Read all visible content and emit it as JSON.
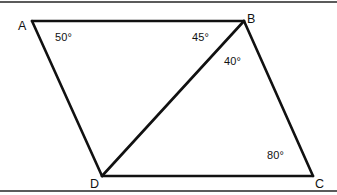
{
  "figure": {
    "type": "geometry-diagram",
    "canvas": {
      "width": 337,
      "height": 195,
      "background": "#ffffff"
    },
    "stroke_color": "#111111",
    "frame_color": "#5b5b5b",
    "vertices": [
      {
        "name": "A",
        "label": "A",
        "x": 32,
        "y": 21,
        "label_x": 18,
        "label_y": 20
      },
      {
        "name": "B",
        "label": "B",
        "x": 244,
        "y": 21,
        "label_x": 247,
        "label_y": 13
      },
      {
        "name": "C",
        "label": "C",
        "x": 313,
        "y": 176,
        "label_x": 315,
        "label_y": 178
      },
      {
        "name": "D",
        "label": "D",
        "x": 102,
        "y": 176,
        "label_x": 90,
        "label_y": 178
      }
    ],
    "edges": [
      {
        "name": "segment-AB",
        "from": "A",
        "to": "B"
      },
      {
        "name": "segment-BC",
        "from": "B",
        "to": "C"
      },
      {
        "name": "segment-CD",
        "from": "C",
        "to": "D"
      },
      {
        "name": "segment-DA",
        "from": "D",
        "to": "A"
      },
      {
        "name": "segment-DB-diagonal",
        "from": "D",
        "to": "B"
      }
    ],
    "angles": [
      {
        "name": "angle-at-A",
        "value": "50°",
        "at_vertex": "A",
        "x": 55,
        "y": 32
      },
      {
        "name": "angle-ABD",
        "value": "45°",
        "at_vertex": "B",
        "x": 192,
        "y": 32
      },
      {
        "name": "angle-DBC",
        "value": "40°",
        "at_vertex": "B",
        "x": 224,
        "y": 56
      },
      {
        "name": "angle-at-C",
        "value": "80°",
        "at_vertex": "C",
        "x": 267,
        "y": 150
      }
    ],
    "frame": {
      "top_rule": true,
      "bottom_rule": true
    }
  }
}
